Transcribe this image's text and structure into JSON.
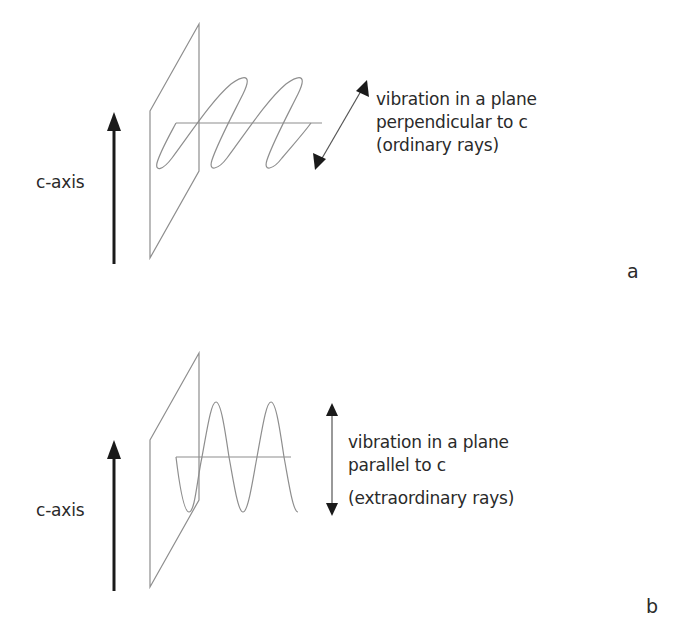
{
  "figure": {
    "panels": [
      {
        "id": "a",
        "panel_label": "a",
        "axis_label": "c-axis",
        "description_lines": [
          "vibration in a plane",
          "perpendicular to c",
          "(ordinary rays)"
        ],
        "wave_orientation": "perpendicular to c-axis (oblique in perspective)"
      },
      {
        "id": "b",
        "panel_label": "b",
        "axis_label": "c-axis",
        "description_lines": [
          "vibration in a plane",
          "parallel to c",
          "(extraordinary rays)"
        ],
        "wave_orientation": "parallel to c-axis (vertical)"
      }
    ],
    "colors": {
      "line": "#8a8a8a",
      "arrow": "#1a1a1a",
      "text": "#2a2a2a",
      "background": "#ffffff"
    }
  }
}
